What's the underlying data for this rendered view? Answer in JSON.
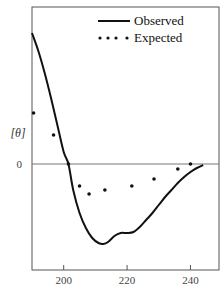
{
  "chart_data": {
    "type": "line",
    "title": "",
    "xlabel": "",
    "ylabel": "[θ]",
    "xlim": [
      190,
      249
    ],
    "ylim": [
      -10.6,
      15.7
    ],
    "x_ticks": [
      200,
      220,
      240
    ],
    "x_tick_labels": [
      "200",
      "220",
      "240"
    ],
    "y_ticks": [
      0
    ],
    "y_tick_labels": [
      "0"
    ],
    "zero_line": true,
    "grid": false,
    "legend_position": "upper right",
    "series": [
      {
        "name": "Observed",
        "style": "solid-line",
        "x": [
          190,
          192,
          194,
          196,
          198,
          200,
          201.5,
          203,
          205,
          207,
          209,
          211,
          212.5,
          214,
          216,
          218,
          220,
          222,
          224,
          226,
          228,
          230,
          232,
          234,
          236,
          238,
          240,
          242,
          244
        ],
        "y": [
          13.1,
          11.3,
          9.1,
          6.6,
          3.9,
          1.2,
          0,
          -2.6,
          -4.9,
          -6.4,
          -7.4,
          -7.9,
          -8.0,
          -7.8,
          -7.2,
          -6.9,
          -6.9,
          -6.8,
          -6.3,
          -5.6,
          -4.9,
          -4.1,
          -3.3,
          -2.6,
          -1.9,
          -1.3,
          -0.8,
          -0.4,
          -0.1
        ]
      },
      {
        "name": "Expected",
        "style": "dots",
        "x": [
          190.5,
          196.8,
          201.5,
          205,
          208,
          213,
          221.5,
          228.5,
          236,
          240
        ],
        "y": [
          5.1,
          2.9,
          0,
          -2.2,
          -3.0,
          -2.6,
          -2.2,
          -1.5,
          -0.5,
          0
        ]
      }
    ]
  },
  "legend": {
    "observed_label": "Observed",
    "expected_label": "Expected"
  },
  "axis": {
    "ylabel": "[θ]",
    "zero_label": "0",
    "x_tick_labels": [
      "200",
      "220",
      "240"
    ]
  }
}
